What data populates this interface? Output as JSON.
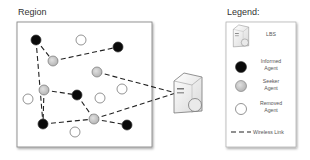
{
  "region": {
    "title": "Region"
  },
  "legend": {
    "title": "Legend:",
    "items": [
      {
        "icon": "server-icon",
        "label_lines": [
          "LBS"
        ]
      },
      {
        "icon": "informed-agent-icon",
        "label_lines": [
          "Informed",
          "Agent"
        ]
      },
      {
        "icon": "seeker-agent-icon",
        "label_lines": [
          "Seeker",
          "Agent"
        ]
      },
      {
        "icon": "removed-agent-icon",
        "label_lines": [
          "Removed",
          "Agent"
        ]
      },
      {
        "icon": "wireless-link-icon",
        "label_lines": [
          "Wireless Link"
        ]
      }
    ]
  },
  "colors": {
    "informed": "#0a0a0a",
    "seeker": "#c8c8c8",
    "removed": "#ffffff",
    "stroke": "#666666",
    "link": "#222222",
    "box": "#888888"
  },
  "nodes": [
    {
      "id": "A",
      "type": "informed",
      "x": 36,
      "y": 40
    },
    {
      "id": "W1",
      "type": "removed",
      "x": 81,
      "y": 40
    },
    {
      "id": "B",
      "type": "informed",
      "x": 118,
      "y": 47
    },
    {
      "id": "C",
      "type": "seeker",
      "x": 53,
      "y": 61
    },
    {
      "id": "D",
      "type": "seeker",
      "x": 97,
      "y": 72
    },
    {
      "id": "E",
      "type": "seeker",
      "x": 44,
      "y": 90
    },
    {
      "id": "F",
      "type": "informed",
      "x": 77,
      "y": 95
    },
    {
      "id": "W2",
      "type": "removed",
      "x": 100,
      "y": 98
    },
    {
      "id": "W3",
      "type": "removed",
      "x": 122,
      "y": 89
    },
    {
      "id": "W4",
      "type": "removed",
      "x": 28,
      "y": 99
    },
    {
      "id": "G",
      "type": "informed",
      "x": 43,
      "y": 124
    },
    {
      "id": "H",
      "type": "seeker",
      "x": 94,
      "y": 119
    },
    {
      "id": "I",
      "type": "informed",
      "x": 127,
      "y": 125
    },
    {
      "id": "W5",
      "type": "removed",
      "x": 75,
      "y": 132
    }
  ],
  "links": [
    [
      "A",
      "C"
    ],
    [
      "A",
      "G"
    ],
    [
      "C",
      "B"
    ],
    [
      "D",
      "LBS"
    ],
    [
      "E",
      "F"
    ],
    [
      "E",
      "G"
    ],
    [
      "F",
      "H"
    ],
    [
      "G",
      "H"
    ],
    [
      "H",
      "I"
    ],
    [
      "H",
      "LBS"
    ]
  ],
  "lbs": {
    "x": 188,
    "y": 95,
    "label": "LBS"
  }
}
